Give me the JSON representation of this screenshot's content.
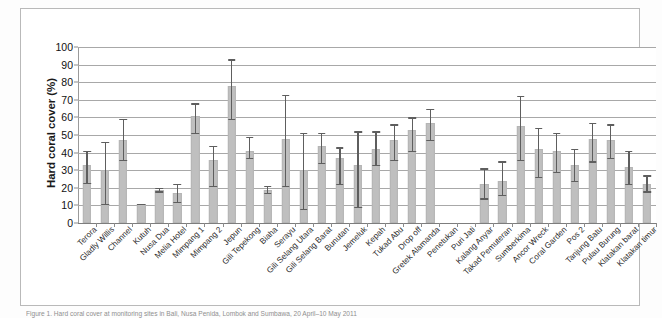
{
  "figure": {
    "caption": "Figure 1. Hard coral cover at monitoring sites in Bali, Nusa Penida, Lombok and Sumbawa, 20 April–10 May 2011"
  },
  "chart_data": {
    "type": "bar",
    "title": "",
    "xlabel": "",
    "ylabel": "Hard coral cover (%)",
    "ylim": [
      0,
      100
    ],
    "ytick_step": 10,
    "yticks": [
      "0",
      "10",
      "20",
      "30",
      "40",
      "50",
      "60",
      "70",
      "80",
      "90",
      "100"
    ],
    "grid": true,
    "legend": false,
    "error_bars": "min-max range",
    "bar_color": "#bfbfbf",
    "error_color": "#5e5e5e",
    "categories": [
      "Terora",
      "Gladly Willis",
      "Channel",
      "Kutuh",
      "Nusa Dua",
      "Melia Hotel",
      "Mimpang 1",
      "Mimpang 2",
      "Jepun",
      "Gili Tepekong",
      "Biaha",
      "Serayu",
      "Gili Selang Utara",
      "Gili Selang Barat",
      "Bunutan",
      "Jemeluk",
      "Kepah",
      "Tukad Abu",
      "Drop off",
      "Gretek Alamanda",
      "Penetukan",
      "Puri Jati",
      "Kalang Anyar",
      "Takad Pemuteran",
      "Sumberkima",
      "Ancor Wreck",
      "Coral Garden",
      "Pos 2",
      "Tanjung Batu",
      "Pulau Burung",
      "Klatakan barat",
      "Klatakan timur"
    ],
    "values": [
      33,
      30,
      47,
      11,
      19,
      17,
      61,
      36,
      78,
      41,
      19,
      48,
      30,
      44,
      37,
      33,
      42,
      47,
      53,
      57,
      null,
      null,
      22,
      24,
      55,
      42,
      41,
      33,
      48,
      47,
      32,
      22
    ],
    "error_low": [
      23,
      11,
      36,
      11,
      18,
      12,
      51,
      21,
      59,
      37,
      17,
      21,
      8,
      34,
      22,
      9,
      33,
      36,
      41,
      47,
      null,
      null,
      14,
      16,
      36,
      26,
      29,
      24,
      35,
      37,
      22,
      18
    ],
    "error_high": [
      41,
      46,
      59,
      11,
      20,
      22,
      68,
      44,
      93,
      49,
      21,
      73,
      51,
      51,
      43,
      52,
      52,
      56,
      60,
      65,
      null,
      null,
      31,
      35,
      72,
      54,
      51,
      42,
      57,
      56,
      41,
      27
    ]
  }
}
